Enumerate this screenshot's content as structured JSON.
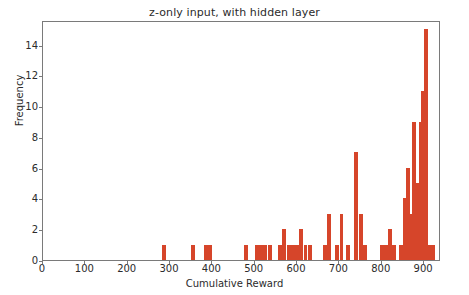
{
  "chart_data": {
    "type": "bar",
    "title": "z-only input, with hidden layer",
    "xlabel": "Cumulative Reward",
    "ylabel": "Frequency",
    "xlim": [
      0,
      940
    ],
    "ylim": [
      0,
      15.6
    ],
    "grid": false,
    "legend": null,
    "bar_color": "#d6452a",
    "bin_width": 9.4,
    "xticks": [
      0,
      100,
      200,
      300,
      400,
      500,
      600,
      700,
      800,
      900
    ],
    "xticklabels": [
      "0",
      "100",
      "200",
      "300",
      "400",
      "500",
      "600",
      "700",
      "800",
      "900"
    ],
    "yticks": [
      0,
      2,
      4,
      6,
      8,
      10,
      12,
      14
    ],
    "yticklabels": [
      "0",
      "2",
      "4",
      "6",
      "8",
      "10",
      "12",
      "14"
    ],
    "bins": [
      {
        "x": 285,
        "value": 1
      },
      {
        "x": 355,
        "value": 1
      },
      {
        "x": 385,
        "value": 1
      },
      {
        "x": 395,
        "value": 1
      },
      {
        "x": 480,
        "value": 1
      },
      {
        "x": 505,
        "value": 1
      },
      {
        "x": 515,
        "value": 1
      },
      {
        "x": 525,
        "value": 1
      },
      {
        "x": 535,
        "value": 1
      },
      {
        "x": 560,
        "value": 1
      },
      {
        "x": 570,
        "value": 2
      },
      {
        "x": 580,
        "value": 1
      },
      {
        "x": 590,
        "value": 1
      },
      {
        "x": 600,
        "value": 1
      },
      {
        "x": 610,
        "value": 2
      },
      {
        "x": 620,
        "value": 1
      },
      {
        "x": 630,
        "value": 1
      },
      {
        "x": 665,
        "value": 1
      },
      {
        "x": 675,
        "value": 3
      },
      {
        "x": 695,
        "value": 1
      },
      {
        "x": 705,
        "value": 3
      },
      {
        "x": 720,
        "value": 1
      },
      {
        "x": 740,
        "value": 7
      },
      {
        "x": 750,
        "value": 3
      },
      {
        "x": 760,
        "value": 1
      },
      {
        "x": 800,
        "value": 1
      },
      {
        "x": 810,
        "value": 1
      },
      {
        "x": 820,
        "value": 2
      },
      {
        "x": 830,
        "value": 1
      },
      {
        "x": 845,
        "value": 1
      },
      {
        "x": 855,
        "value": 4
      },
      {
        "x": 862,
        "value": 6
      },
      {
        "x": 870,
        "value": 3
      },
      {
        "x": 877,
        "value": 9
      },
      {
        "x": 885,
        "value": 5
      },
      {
        "x": 892,
        "value": 9
      },
      {
        "x": 898,
        "value": 11
      },
      {
        "x": 905,
        "value": 15
      },
      {
        "x": 912,
        "value": 1
      },
      {
        "x": 920,
        "value": 1
      }
    ]
  }
}
